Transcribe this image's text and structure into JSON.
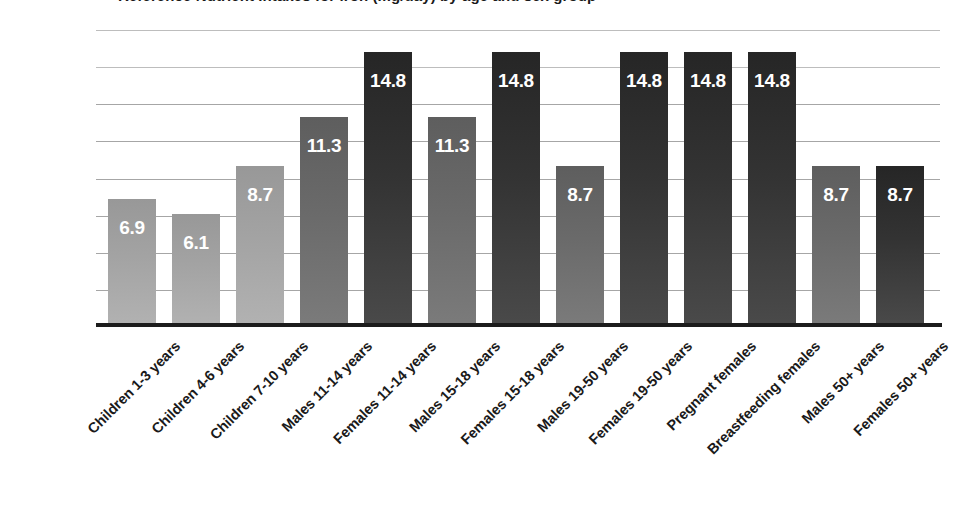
{
  "chart_data": {
    "type": "bar",
    "title": "Reference Nutrient Intakes for iron (mg/day) by age and sex group",
    "subtitle": "",
    "xlabel": "",
    "ylabel": "",
    "ylim": [
      0,
      16
    ],
    "grid": true,
    "gridlines": [
      2,
      4,
      6,
      8,
      10,
      12,
      14,
      16
    ],
    "legend": "none",
    "axis_tick_labels_visible": false,
    "categories": [
      "Children 1-3 years",
      "Children 4-6 years",
      "Children 7-10 years",
      "Males 11-14 years",
      "Females 11-14 years",
      "Males 15-18 years",
      "Females 15-18 years",
      "Males 19-50 years",
      "Females 19-50 years",
      "Pregnant females",
      "Breastfeeding females",
      "Males 50+ years",
      "Females 50+ years"
    ],
    "values": [
      6.9,
      6.1,
      8.7,
      11.3,
      14.8,
      11.3,
      14.8,
      8.7,
      14.8,
      14.8,
      14.8,
      8.7,
      8.7
    ],
    "data_labels": [
      "6.9",
      "6.1",
      "8.7",
      "11.3",
      "14.8",
      "11.3",
      "14.8",
      "8.7",
      "14.8",
      "14.8",
      "14.8",
      "8.7",
      "8.7"
    ],
    "bar_styles": [
      "light",
      "light",
      "light",
      "medium",
      "dark",
      "medium",
      "dark",
      "medium",
      "dark",
      "dark",
      "dark",
      "medium",
      "dark"
    ],
    "colors": {
      "light": "#a8a8a8",
      "medium": "#6b6b6b",
      "dark": "#333333",
      "gridline": "#a6a6a6",
      "axis": "#1c1c1c",
      "data_label_text": "#ffffff",
      "category_label_text": "#1a1a1a",
      "background": "#ffffff"
    }
  }
}
